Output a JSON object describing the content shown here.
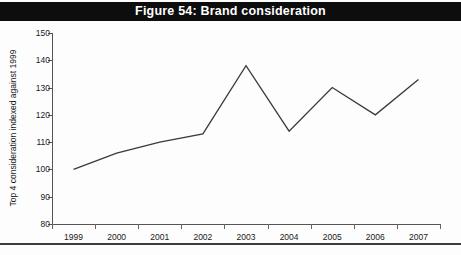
{
  "title": "Figure 54: Brand consideration",
  "colors": {
    "banner_background": "#0d0d0d",
    "banner_text": "#ffffff",
    "line": "#3a3a3a",
    "axis": "#555555",
    "page_background": "#ffffff"
  },
  "chart_data": {
    "type": "line",
    "title": "Figure 54: Brand consideration",
    "xlabel": "",
    "ylabel": "Top 4 consideration indexed against 1999",
    "categories": [
      "1999",
      "2000",
      "2001",
      "2002",
      "2003",
      "2004",
      "2005",
      "2006",
      "2007"
    ],
    "values": [
      100,
      106,
      110,
      113,
      138,
      114,
      130,
      120,
      133
    ],
    "series": [
      {
        "name": "Top 4 consideration indexed against 1999",
        "values": [
          100,
          106,
          110,
          113,
          138,
          114,
          130,
          120,
          133
        ]
      }
    ],
    "ylim": [
      80,
      150
    ],
    "yticks": [
      80,
      90,
      100,
      110,
      120,
      130,
      140,
      150
    ],
    "ytick_labels": [
      "80",
      "90",
      "100",
      "110",
      "120",
      "130",
      "140",
      "150"
    ],
    "xtick_labels": [
      "1999",
      "2000",
      "2001",
      "2002",
      "2003",
      "2004",
      "2005",
      "2006",
      "2007"
    ],
    "grid": false,
    "legend": false,
    "legend_position": "none"
  }
}
